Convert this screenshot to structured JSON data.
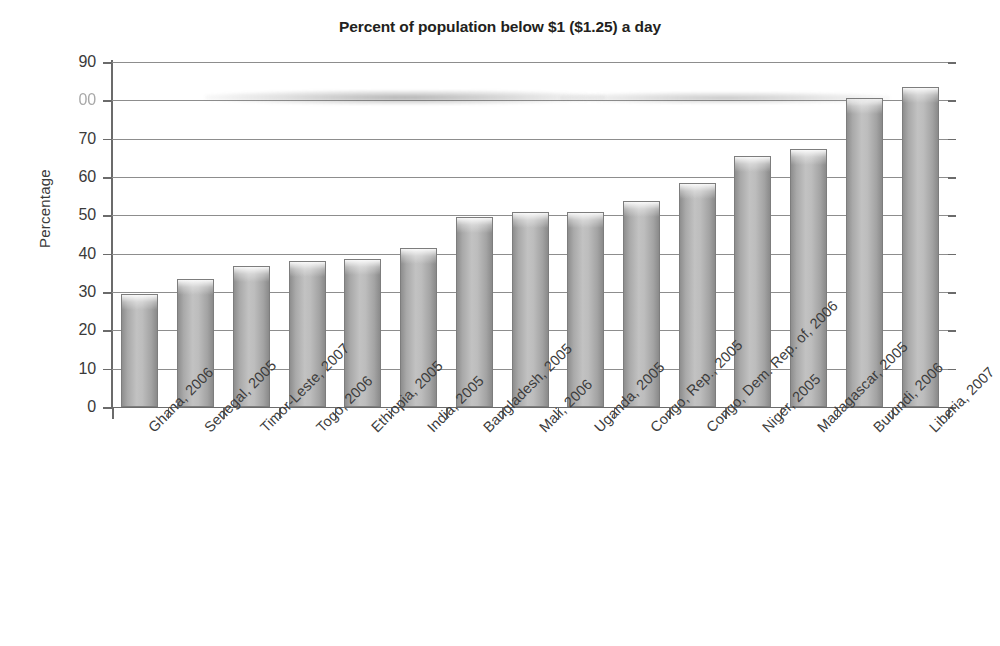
{
  "chart_data": {
    "type": "bar",
    "title": "Percent of population below $1 ($1.25) a day",
    "xlabel": "",
    "ylabel": "Percentage",
    "ylim": [
      0,
      90
    ],
    "ytick_step": 10,
    "yticks": [
      "0",
      "10",
      "20",
      "30",
      "40",
      "50",
      "60",
      "70",
      "00",
      "90"
    ],
    "ytick_values": [
      0,
      10,
      20,
      30,
      40,
      50,
      60,
      70,
      80,
      90
    ],
    "grid": "horizontal",
    "legend": "none",
    "categories": [
      "Ghana, 2006",
      "Senegal, 2005",
      "Timor-Leste, 2007",
      "Togo, 2006",
      "Ethiopia, 2005",
      "India, 2005",
      "Bangladesh, 2005",
      "Mali, 2006",
      "Uganda, 2005",
      "Congo, Rep., 2005",
      "Congo, Dem. Rep. of, 2006",
      "Niger, 2005",
      "Madagascar, 2005",
      "Burundi, 2006",
      "Liberia, 2007"
    ],
    "values": [
      29.5,
      33.5,
      36.8,
      38.2,
      38.6,
      41.5,
      49.5,
      51,
      51,
      53.8,
      58.5,
      65.5,
      67.3,
      80.5,
      83.5
    ],
    "bar_color": "#b0b0b0",
    "annotations": [
      {
        "name": "scan-smudge",
        "note": "horizontal scan artifact across plot near the 80 gridline; the 80 y-axis tick label is degraded and reads as 00"
      }
    ]
  }
}
